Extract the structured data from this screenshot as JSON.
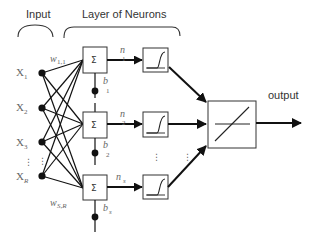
{
  "headers": {
    "input": "Input",
    "layer": "Layer of Neurons",
    "output": "output"
  },
  "inputs": [
    {
      "base": "X",
      "sub": "1"
    },
    {
      "base": "X",
      "sub": "2"
    },
    {
      "base": "X",
      "sub": "3"
    },
    {
      "base": "X",
      "sub": "R"
    }
  ],
  "weights": {
    "first": {
      "base": "w",
      "sub": "1,1"
    },
    "last": {
      "base": "w",
      "sub": "S,R"
    }
  },
  "neurons": [
    {
      "sum_symbol": "Σ",
      "net": {
        "base": "n",
        "sub": "1"
      },
      "bias": {
        "base": "b",
        "sub": "1"
      }
    },
    {
      "sum_symbol": "Σ",
      "net": {
        "base": "n",
        "sub": "2"
      },
      "bias": {
        "base": "b",
        "sub": "2"
      }
    },
    {
      "sum_symbol": "Σ",
      "net": {
        "base": "n",
        "sub": "s"
      },
      "bias": {
        "base": "b",
        "sub": "s"
      }
    }
  ],
  "ellipsis": "⋮",
  "icons": {
    "sigmoid": "sigmoid-transfer-icon",
    "linear": "linear-transfer-icon"
  },
  "colors": {
    "line": "#111111",
    "box": "#333333",
    "label": "#666666"
  }
}
